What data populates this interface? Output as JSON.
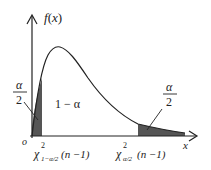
{
  "diagram": {
    "type": "chi-square density with two-tailed rejection regions",
    "y_axis_label": "f(x)",
    "x_axis_label": "x",
    "origin_label": "o",
    "center_area_label": "1 − α",
    "left_tail_label": {
      "num": "α",
      "den": "2"
    },
    "right_tail_label": {
      "num": "α",
      "den": "2"
    },
    "left_quantile": {
      "base": "χ",
      "sup": "2",
      "sub": "1−α/2",
      "arg": "(n −1)"
    },
    "right_quantile": {
      "base": "χ",
      "sup": "2",
      "sub": "α/2",
      "arg": "(n −1)"
    },
    "colors": {
      "curve": "#222222",
      "shade": "#555555",
      "background": "#ffffff"
    }
  }
}
